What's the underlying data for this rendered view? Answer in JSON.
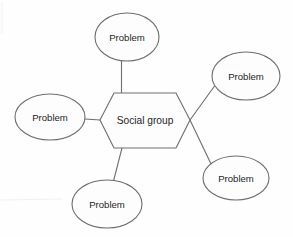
{
  "diagram": {
    "type": "mind-map",
    "title_visible": false,
    "background_color": "#fefefe",
    "stroke_color": "#6e6e6e",
    "text_color": "#1d1d1d",
    "center_node": {
      "label": "Social group",
      "shape": "hexagon",
      "cx": 145,
      "cy": 120,
      "points": "100,120 114,93 176,93 190,120 176,148 114,148"
    },
    "leaf_nodes": [
      {
        "id": "problem-top",
        "label": "Problem",
        "shape": "ellipse",
        "cx": 127,
        "cy": 37,
        "rx": 32,
        "ry": 24
      },
      {
        "id": "problem-top-right",
        "label": "Problem",
        "shape": "ellipse",
        "cx": 246,
        "cy": 76,
        "rx": 34,
        "ry": 24
      },
      {
        "id": "problem-left",
        "label": "Problem",
        "shape": "ellipse",
        "cx": 50,
        "cy": 117,
        "rx": 35,
        "ry": 23
      },
      {
        "id": "problem-bottom-right",
        "label": "Problem",
        "shape": "ellipse",
        "cx": 236,
        "cy": 178,
        "rx": 33,
        "ry": 22
      },
      {
        "id": "problem-bottom",
        "label": "Problem",
        "shape": "ellipse",
        "cx": 107,
        "cy": 204,
        "rx": 35,
        "ry": 24
      }
    ],
    "connectors": [
      {
        "id": "link-center-to-top",
        "from": "center_node",
        "to": "problem-top",
        "path": "M 121.5 61.5 L 121.5 93"
      },
      {
        "id": "link-center-to-top-right",
        "from": "center_node",
        "to": "problem-top-right",
        "path": "M 190 120 L 216 84"
      },
      {
        "id": "link-center-to-left",
        "from": "center_node",
        "to": "problem-left",
        "path": "M 85 119 L 100 120"
      },
      {
        "id": "link-center-to-bottom-right",
        "from": "center_node",
        "to": "problem-bottom-right",
        "path": "M 190 120 L 212 166"
      },
      {
        "id": "link-center-to-bottom",
        "from": "center_node",
        "to": "problem-bottom",
        "path": "M 122 148 L 113.5 181"
      }
    ]
  }
}
